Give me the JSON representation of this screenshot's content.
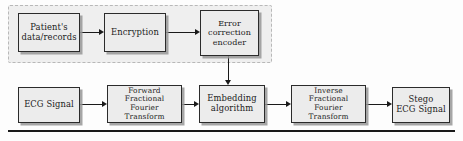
{
  "diagram": {
    "colors": {
      "node_fill": "#ececec",
      "node_border": "#2b2b2b",
      "node_shadow": "#969696",
      "group_fill": "#efefef",
      "group_border": "#b8b8b8",
      "arrow": "#1a1a1a",
      "rule": "#1a1a1a",
      "background": "#fdfdfd"
    },
    "group_region": {
      "name": "secret-data-group",
      "x": 8,
      "y": 5,
      "width": 264,
      "height": 58,
      "border_style": "dashed"
    },
    "nodes": [
      {
        "id": "patient-data",
        "label": "Patient's\ndata/records",
        "x": 18,
        "y": 13,
        "width": 62,
        "height": 39,
        "font_size": 8.4
      },
      {
        "id": "encryption",
        "label": "Encryption",
        "x": 104,
        "y": 13,
        "width": 62,
        "height": 39,
        "font_size": 8.4
      },
      {
        "id": "error-correction",
        "label": "Error\ncorrection\nencoder",
        "x": 200,
        "y": 10,
        "width": 59,
        "height": 46,
        "font_size": 8.0
      },
      {
        "id": "ecg-signal",
        "label": "ECG Signal",
        "x": 18,
        "y": 87,
        "width": 62,
        "height": 36,
        "font_size": 8.4
      },
      {
        "id": "forward-frft",
        "label": "Forward\nFractional\nFourier Transform",
        "x": 107,
        "y": 85,
        "width": 75,
        "height": 38,
        "font_size": 7.4
      },
      {
        "id": "embedding",
        "label": "Embedding\nalgorithm",
        "x": 199,
        "y": 85,
        "width": 66,
        "height": 38,
        "font_size": 8.4
      },
      {
        "id": "inverse-frft",
        "label": "Inverse\nFractional\nFourier Transform",
        "x": 291,
        "y": 85,
        "width": 75,
        "height": 38,
        "font_size": 7.4
      },
      {
        "id": "stego-ecg",
        "label": "Stego\nECG Signal",
        "x": 392,
        "y": 87,
        "width": 58,
        "height": 36,
        "font_size": 8.4
      }
    ],
    "connectors": [
      {
        "id": "patient-to-encryption",
        "orient": "h",
        "x": 80,
        "y": 32,
        "length": 19
      },
      {
        "id": "encryption-to-ecc",
        "orient": "h",
        "x": 166,
        "y": 32,
        "length": 29
      },
      {
        "id": "ecc-to-embedding",
        "orient": "v",
        "x": 228,
        "y": 56,
        "length": 24
      },
      {
        "id": "ecg-to-forward",
        "orient": "h",
        "x": 80,
        "y": 104,
        "length": 22
      },
      {
        "id": "forward-to-embedding",
        "orient": "h",
        "x": 182,
        "y": 104,
        "length": 12
      },
      {
        "id": "embedding-to-inverse",
        "orient": "h",
        "x": 265,
        "y": 104,
        "length": 21
      },
      {
        "id": "inverse-to-stego",
        "orient": "h",
        "x": 366,
        "y": 104,
        "length": 21
      }
    ],
    "bottom_rule": {
      "x": 8,
      "y": 130,
      "width": 447,
      "height": 2.4
    }
  }
}
